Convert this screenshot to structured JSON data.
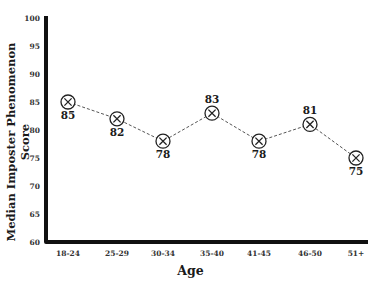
{
  "chart_data": {
    "type": "line",
    "title": "",
    "xlabel": "Age",
    "ylabel": "Median Imposter Phenomenon Score",
    "categories": [
      "18-24",
      "25-29",
      "30-34",
      "35-40",
      "41-45",
      "46-50",
      "51+"
    ],
    "series": [
      {
        "name": "Median Imposter Phenomenon Score",
        "values": [
          85,
          82,
          78,
          83,
          78,
          81,
          75
        ]
      }
    ],
    "data_labels": [
      "85",
      "82",
      "78",
      "83",
      "78",
      "81",
      "75"
    ],
    "data_label_positions": [
      "below",
      "below",
      "below",
      "above",
      "below",
      "above",
      "below"
    ],
    "ylim": [
      60,
      100
    ],
    "yticks": [
      60,
      65,
      70,
      75,
      80,
      85,
      90,
      95,
      100
    ],
    "marker": "circled-x",
    "line_style": "dashed",
    "grid": false,
    "legend": null
  },
  "colors": {
    "axis": "#111111",
    "line": "#555555",
    "marker": "#222222",
    "text": "#1a1a1a"
  }
}
